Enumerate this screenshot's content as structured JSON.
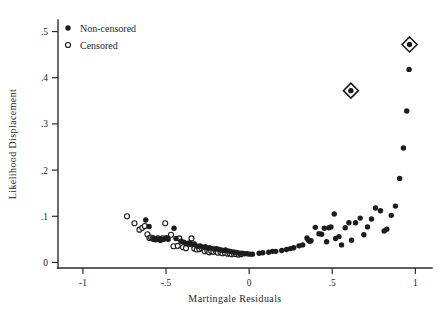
{
  "chart_data": {
    "type": "scatter",
    "title": "",
    "xlabel": "Martingale Residuals",
    "ylabel": "Likelihood Displacement",
    "xlim": [
      -1.15,
      1.1
    ],
    "ylim": [
      -0.012,
      0.525
    ],
    "xticks": [
      -1,
      -0.5,
      0,
      0.5,
      1
    ],
    "xticklabels": [
      "-1",
      "-.5",
      "0",
      ".5",
      "1"
    ],
    "yticks": [
      0,
      0.1,
      0.2,
      0.3,
      0.4,
      0.5
    ],
    "yticklabels": [
      "0",
      ".1",
      ".2",
      ".3",
      ".4",
      ".5"
    ],
    "grid": false,
    "legend_position": "top-left",
    "legend": [
      {
        "label": "Non-censored",
        "marker": "filled-circle"
      },
      {
        "label": "Censored",
        "marker": "open-circle"
      }
    ],
    "series": [
      {
        "name": "Censored",
        "marker": "open-circle",
        "points": [
          [
            -0.735,
            0.1
          ],
          [
            -0.69,
            0.085
          ],
          [
            -0.66,
            0.071
          ],
          [
            -0.643,
            0.075
          ],
          [
            -0.628,
            0.079
          ],
          [
            -0.612,
            0.061
          ],
          [
            -0.6,
            0.053
          ],
          [
            -0.59,
            0.054
          ],
          [
            -0.58,
            0.052
          ],
          [
            -0.572,
            0.051
          ],
          [
            -0.563,
            0.05
          ],
          [
            -0.556,
            0.051
          ],
          [
            -0.548,
            0.052
          ],
          [
            -0.54,
            0.05
          ],
          [
            -0.533,
            0.049
          ],
          [
            -0.52,
            0.052
          ],
          [
            -0.505,
            0.085
          ],
          [
            -0.496,
            0.053
          ],
          [
            -0.47,
            0.06
          ],
          [
            -0.455,
            0.035
          ],
          [
            -0.43,
            0.036
          ],
          [
            -0.42,
            0.052
          ],
          [
            -0.398,
            0.033
          ],
          [
            -0.38,
            0.031
          ],
          [
            -0.355,
            0.04
          ],
          [
            -0.347,
            0.052
          ],
          [
            -0.33,
            0.03
          ],
          [
            -0.315,
            0.028
          ],
          [
            -0.3,
            0.029
          ],
          [
            -0.286,
            0.031
          ],
          [
            -0.268,
            0.024
          ],
          [
            -0.252,
            0.026
          ],
          [
            -0.24,
            0.022
          ],
          [
            -0.228,
            0.025
          ],
          [
            -0.215,
            0.023
          ],
          [
            -0.2,
            0.024
          ],
          [
            -0.188,
            0.021
          ],
          [
            -0.172,
            0.022
          ],
          [
            -0.16,
            0.02
          ],
          [
            -0.146,
            0.021
          ],
          [
            -0.13,
            0.019
          ],
          [
            -0.118,
            0.02
          ],
          [
            -0.105,
            0.018
          ],
          [
            -0.092,
            0.019
          ],
          [
            -0.078,
            0.018
          ],
          [
            -0.064,
            0.017
          ],
          [
            -0.05,
            0.018
          ]
        ]
      },
      {
        "name": "Non-censored",
        "marker": "filled-circle",
        "points": [
          [
            -0.622,
            0.092
          ],
          [
            -0.602,
            0.078
          ],
          [
            -0.57,
            0.051
          ],
          [
            -0.558,
            0.05
          ],
          [
            -0.546,
            0.05
          ],
          [
            -0.536,
            0.049
          ],
          [
            -0.526,
            0.05
          ],
          [
            -0.514,
            0.05
          ],
          [
            -0.5,
            0.052
          ],
          [
            -0.487,
            0.05
          ],
          [
            -0.452,
            0.074
          ],
          [
            -0.44,
            0.052
          ],
          [
            -0.41,
            0.046
          ],
          [
            -0.392,
            0.044
          ],
          [
            -0.372,
            0.041
          ],
          [
            -0.36,
            0.042
          ],
          [
            -0.344,
            0.039
          ],
          [
            -0.33,
            0.04
          ],
          [
            -0.312,
            0.035
          ],
          [
            -0.295,
            0.036
          ],
          [
            -0.28,
            0.033
          ],
          [
            -0.264,
            0.034
          ],
          [
            -0.25,
            0.031
          ],
          [
            -0.238,
            0.032
          ],
          [
            -0.222,
            0.03
          ],
          [
            -0.208,
            0.029
          ],
          [
            -0.196,
            0.03
          ],
          [
            -0.182,
            0.028
          ],
          [
            -0.17,
            0.027
          ],
          [
            -0.156,
            0.026
          ],
          [
            -0.142,
            0.027
          ],
          [
            -0.128,
            0.025
          ],
          [
            -0.114,
            0.024
          ],
          [
            -0.1,
            0.023
          ],
          [
            -0.086,
            0.022
          ],
          [
            -0.072,
            0.021
          ],
          [
            -0.058,
            0.02
          ],
          [
            -0.042,
            0.02
          ],
          [
            -0.028,
            0.019
          ],
          [
            -0.012,
            0.019
          ],
          [
            0.004,
            0.018
          ],
          [
            0.02,
            0.018
          ],
          [
            0.06,
            0.02
          ],
          [
            0.082,
            0.021
          ],
          [
            0.118,
            0.022
          ],
          [
            0.14,
            0.024
          ],
          [
            0.16,
            0.024
          ],
          [
            0.196,
            0.026
          ],
          [
            0.225,
            0.028
          ],
          [
            0.248,
            0.03
          ],
          [
            0.268,
            0.032
          ],
          [
            0.3,
            0.036
          ],
          [
            0.322,
            0.038
          ],
          [
            0.348,
            0.053
          ],
          [
            0.356,
            0.048
          ],
          [
            0.364,
            0.046
          ],
          [
            0.372,
            0.047
          ],
          [
            0.398,
            0.076
          ],
          [
            0.42,
            0.062
          ],
          [
            0.436,
            0.061
          ],
          [
            0.452,
            0.074
          ],
          [
            0.466,
            0.045
          ],
          [
            0.48,
            0.075
          ],
          [
            0.492,
            0.077
          ],
          [
            0.512,
            0.105
          ],
          [
            0.52,
            0.052
          ],
          [
            0.54,
            0.056
          ],
          [
            0.556,
            0.038
          ],
          [
            0.578,
            0.075
          ],
          [
            0.6,
            0.086
          ],
          [
            0.616,
            0.048
          ],
          [
            0.64,
            0.086
          ],
          [
            0.668,
            0.096
          ],
          [
            0.69,
            0.06
          ],
          [
            0.712,
            0.077
          ],
          [
            0.736,
            0.094
          ],
          [
            0.76,
            0.118
          ],
          [
            0.79,
            0.112
          ],
          [
            0.812,
            0.068
          ],
          [
            0.828,
            0.072
          ],
          [
            0.855,
            0.102
          ],
          [
            0.88,
            0.122
          ],
          [
            0.905,
            0.182
          ],
          [
            0.928,
            0.248
          ],
          [
            0.948,
            0.328
          ],
          [
            0.962,
            0.418
          ],
          [
            0.612,
            0.372
          ],
          [
            0.965,
            0.472
          ]
        ]
      }
    ],
    "highlighted": [
      {
        "x": 0.612,
        "y": 0.372,
        "marker": "diamond-outline"
      },
      {
        "x": 0.965,
        "y": 0.472,
        "marker": "diamond-outline"
      }
    ]
  }
}
